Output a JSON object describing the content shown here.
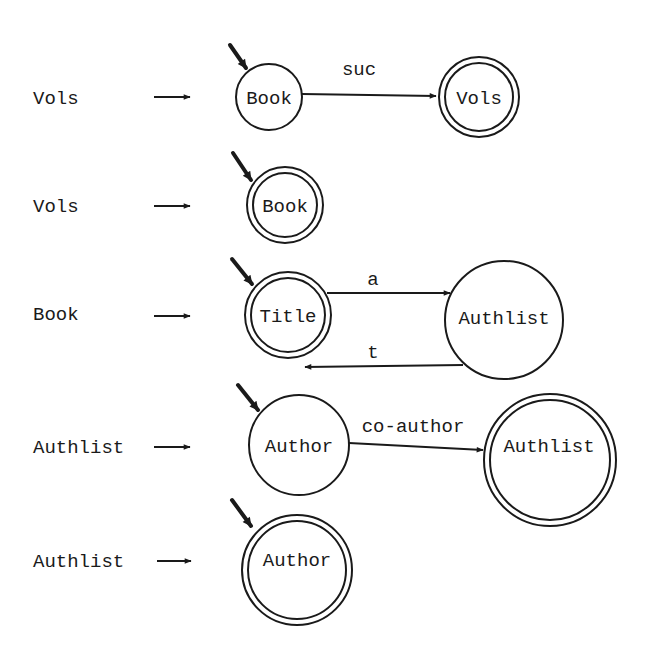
{
  "diagram": {
    "type": "state-transition-diagrams",
    "colors": {
      "ink": "#1a1a1a",
      "background": "#ffffff"
    },
    "rows": [
      {
        "lhs": "Vols",
        "arrow_icon": "right-arrow",
        "states": [
          {
            "label": "Book",
            "start": true,
            "final": false
          },
          {
            "label": "Vols",
            "start": false,
            "final": true
          }
        ],
        "transitions": [
          {
            "from": "Book",
            "to": "Vols",
            "label": "suc"
          }
        ]
      },
      {
        "lhs": "Vols",
        "arrow_icon": "right-arrow",
        "states": [
          {
            "label": "Book",
            "start": true,
            "final": true
          }
        ],
        "transitions": []
      },
      {
        "lhs": "Book",
        "arrow_icon": "right-arrow",
        "states": [
          {
            "label": "Title",
            "start": true,
            "final": true
          },
          {
            "label": "Authlist",
            "start": false,
            "final": false
          }
        ],
        "transitions": [
          {
            "from": "Title",
            "to": "Authlist",
            "label": "a"
          },
          {
            "from": "Authlist",
            "to": "Title",
            "label": "t"
          }
        ]
      },
      {
        "lhs": "Authlist",
        "arrow_icon": "right-arrow",
        "states": [
          {
            "label": "Author",
            "start": true,
            "final": false
          },
          {
            "label": "Authlist",
            "start": false,
            "final": true
          }
        ],
        "transitions": [
          {
            "from": "Author",
            "to": "Authlist",
            "label": "co-author"
          }
        ]
      },
      {
        "lhs": "Authlist",
        "arrow_icon": "right-arrow",
        "states": [
          {
            "label": "Author",
            "start": true,
            "final": true
          }
        ],
        "transitions": []
      }
    ]
  }
}
